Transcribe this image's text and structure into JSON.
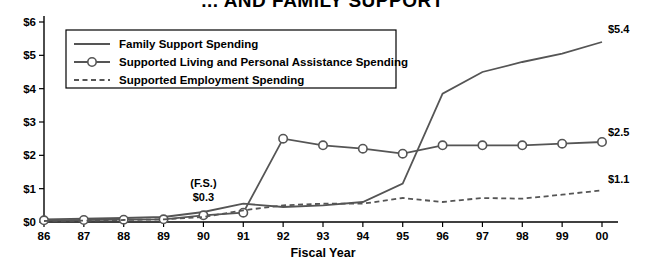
{
  "chart_data": {
    "type": "line",
    "title": "... AND FAMILY SUPPORT",
    "xlabel": "Fiscal Year",
    "ylabel": "",
    "categories": [
      "86",
      "87",
      "88",
      "89",
      "90",
      "91",
      "92",
      "93",
      "94",
      "95",
      "96",
      "97",
      "98",
      "99",
      "00"
    ],
    "ylim": [
      0,
      6
    ],
    "ytick_labels": [
      "$0",
      "$1",
      "$2",
      "$3",
      "$4",
      "$5",
      "$6"
    ],
    "ytick_values": [
      0,
      1,
      2,
      3,
      4,
      5,
      6
    ],
    "grid": false,
    "legend_position": "upper-left-inside",
    "series": [
      {
        "name": "Family Support Spending",
        "marker": "none",
        "style": "solid",
        "color": "#555555",
        "values": [
          0.08,
          0.1,
          0.12,
          0.15,
          0.3,
          0.55,
          0.45,
          0.5,
          0.6,
          1.15,
          3.85,
          4.5,
          4.8,
          5.05,
          5.4
        ],
        "end_label": "$5.4"
      },
      {
        "name": "Supported Living and Personal Assistance Spending",
        "marker": "circle",
        "style": "solid",
        "color": "#555555",
        "values": [
          0.05,
          0.06,
          0.07,
          0.08,
          0.2,
          0.28,
          2.5,
          2.3,
          2.2,
          2.05,
          2.3,
          2.3,
          2.3,
          2.35,
          2.4
        ],
        "end_label": "$2.5"
      },
      {
        "name": "Supported Employment Spending",
        "marker": "none",
        "style": "dashed",
        "color": "#555555",
        "values": [
          0.03,
          0.04,
          0.06,
          0.08,
          0.15,
          0.35,
          0.5,
          0.55,
          0.55,
          0.72,
          0.6,
          0.72,
          0.7,
          0.82,
          0.95
        ],
        "end_label": "$1.1"
      }
    ],
    "annotations": [
      {
        "text": "(F.S.)",
        "at_x": "90",
        "value": 1.05
      },
      {
        "text": "$0.3",
        "at_x": "90",
        "value": 0.62
      }
    ]
  },
  "legend": {
    "items": [
      {
        "label": "Family Support Spending"
      },
      {
        "label": "Supported Living and Personal Assistance Spending"
      },
      {
        "label": "Supported Employment Spending"
      }
    ]
  }
}
